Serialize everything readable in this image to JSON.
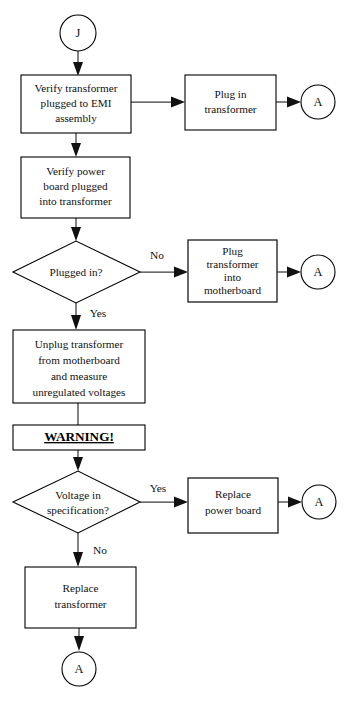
{
  "diagram": {
    "background_color": "#ffffff",
    "line_color": "#3a3a3a",
    "text_color": "#111111"
  },
  "nodes": {
    "start_connector": {
      "label": "J",
      "shape": "circle"
    },
    "verify_transformer": {
      "line1": "Verify transformer",
      "line2": "plugged to EMI",
      "line3": "assembly",
      "shape": "process"
    },
    "plug_in_transformer": {
      "line1": "Plug in",
      "line2": "transformer",
      "shape": "process"
    },
    "connector_a_1": {
      "label": "A",
      "shape": "circle"
    },
    "verify_power_board": {
      "line1": "Verify power",
      "line2": "board plugged",
      "line3": "into transformer",
      "shape": "process"
    },
    "plugged_in_decision": {
      "line1": "Plugged in?",
      "shape": "decision"
    },
    "plug_transformer_motherboard": {
      "line1": "Plug",
      "line2": "transformer",
      "line3": "into",
      "line4": "motherboard",
      "shape": "process"
    },
    "connector_a_2": {
      "label": "A",
      "shape": "circle"
    },
    "unplug_measure": {
      "line1": "Unplug transformer",
      "line2": "from motherboard",
      "line3": "and measure",
      "line4": "unregulated voltages",
      "shape": "process"
    },
    "warning": {
      "label": "WARNING!",
      "shape": "process",
      "emphasis": "bold-underline"
    },
    "voltage_decision": {
      "line1": "Voltage in",
      "line2": "specification?",
      "shape": "decision"
    },
    "replace_power_board": {
      "line1": "Replace",
      "line2": "power board",
      "shape": "process"
    },
    "connector_a_3": {
      "label": "A",
      "shape": "circle"
    },
    "replace_transformer": {
      "line1": "Replace",
      "line2": "transformer",
      "shape": "process"
    },
    "connector_a_4": {
      "label": "A",
      "shape": "circle"
    }
  },
  "edge_labels": {
    "plugged_in_no": "No",
    "plugged_in_yes": "Yes",
    "voltage_yes": "Yes",
    "voltage_no": "No"
  }
}
